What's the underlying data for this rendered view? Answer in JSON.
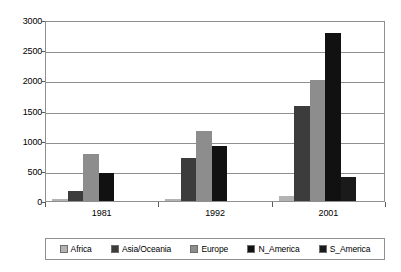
{
  "chart_data": {
    "type": "bar",
    "title": "",
    "subtitle": "",
    "xlabel": "",
    "ylabel": "",
    "categories": [
      "1981",
      "1992",
      "2001"
    ],
    "ylim": [
      0,
      3000
    ],
    "yticks": [
      0,
      500,
      1000,
      1500,
      2000,
      2500,
      3000
    ],
    "ytick_labels": [
      "0",
      "500",
      "1000",
      "1500",
      "2000",
      "2500",
      "3000"
    ],
    "grid": true,
    "legend_position": "bottom",
    "series": [
      {
        "name": "Africa",
        "color": "#b3b3b3",
        "values": [
          30,
          40,
          80
        ]
      },
      {
        "name": "Asia/Oceania",
        "color": "#3c3c3c",
        "values": [
          160,
          720,
          1575
        ]
      },
      {
        "name": "Europe",
        "color": "#8d8d8d",
        "values": [
          780,
          1155,
          2010
        ]
      },
      {
        "name": "N_America",
        "color": "#111111",
        "values": [
          465,
          920,
          2780
        ]
      },
      {
        "name": "S_America",
        "color": "#1a1a1a",
        "values": [
          0,
          0,
          390
        ]
      }
    ]
  },
  "legend": {
    "items": [
      {
        "label": "Africa",
        "swatch": "#b3b3b3"
      },
      {
        "label": "Asia/Oceania",
        "swatch": "#3c3c3c"
      },
      {
        "label": "Europe",
        "swatch": "#8d8d8d"
      },
      {
        "label": "N_America",
        "swatch": "#111111"
      },
      {
        "label": "S_America",
        "swatch": "#1a1a1a"
      }
    ]
  },
  "colors": {
    "axis": "#8f8f8f",
    "grid": "#8f8f8f",
    "tick": "#5a5a5a",
    "text": "#000000",
    "background": "#ffffff"
  }
}
